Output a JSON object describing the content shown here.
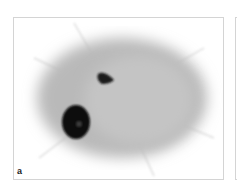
{
  "figure": {
    "panels": [
      {
        "label": "a",
        "content": "grayscale scintigraphy image: diffuse gray oval uptake with two dark hot spots (small triangular spot upper-center-left, large round spot lower-left)"
      }
    ]
  },
  "colors": {
    "background": "#ffffff",
    "border": "#d4d4d4",
    "uptake": "#a8a8a8",
    "hotspot": "#0a0a0a"
  }
}
